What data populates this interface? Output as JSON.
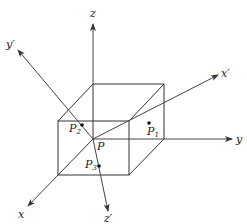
{
  "diagram": {
    "axes": [
      {
        "id": "z",
        "label": "z"
      },
      {
        "id": "y",
        "label": "y"
      },
      {
        "id": "x",
        "label": "x"
      },
      {
        "id": "x-prime",
        "label": "x′"
      },
      {
        "id": "y-prime",
        "label": "y′"
      },
      {
        "id": "z-prime",
        "label": "z′"
      }
    ],
    "points": [
      {
        "id": "P",
        "label": "P",
        "sub": ""
      },
      {
        "id": "P1",
        "label": "P",
        "sub": "1"
      },
      {
        "id": "P2",
        "label": "P",
        "sub": "2"
      },
      {
        "id": "P3",
        "label": "P",
        "sub": "3"
      }
    ],
    "colors": {
      "line": "#333333",
      "background": "#ffffff"
    }
  }
}
